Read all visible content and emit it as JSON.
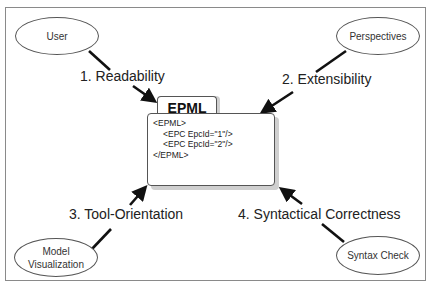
{
  "diagram": {
    "center": {
      "tab_label": "EPML",
      "code_lines": [
        "<EPML>",
        "<EPC EpcId=\"1\"/>",
        "<EPC EpcId=\"2\"/>",
        "</EPML>"
      ]
    },
    "nodes": [
      {
        "id": "user",
        "label": "User"
      },
      {
        "id": "perspectives",
        "label": "Perspectives"
      },
      {
        "id": "model-visualization",
        "label_line1": "Model",
        "label_line2": "Visualization"
      },
      {
        "id": "syntax-check",
        "label": "Syntax Check"
      }
    ],
    "edges": [
      {
        "from": "user",
        "label": "1. Readability"
      },
      {
        "from": "perspectives",
        "label": "2. Extensibility"
      },
      {
        "from": "model-visualization",
        "label": "3. Tool-Orientation"
      },
      {
        "from": "syntax-check",
        "label": "4. Syntactical Correctness"
      }
    ],
    "colors": {
      "stroke": "#555555",
      "arrow": "#111111",
      "shadow": "#cfcfcf",
      "frame": "#8a8a8a"
    }
  }
}
